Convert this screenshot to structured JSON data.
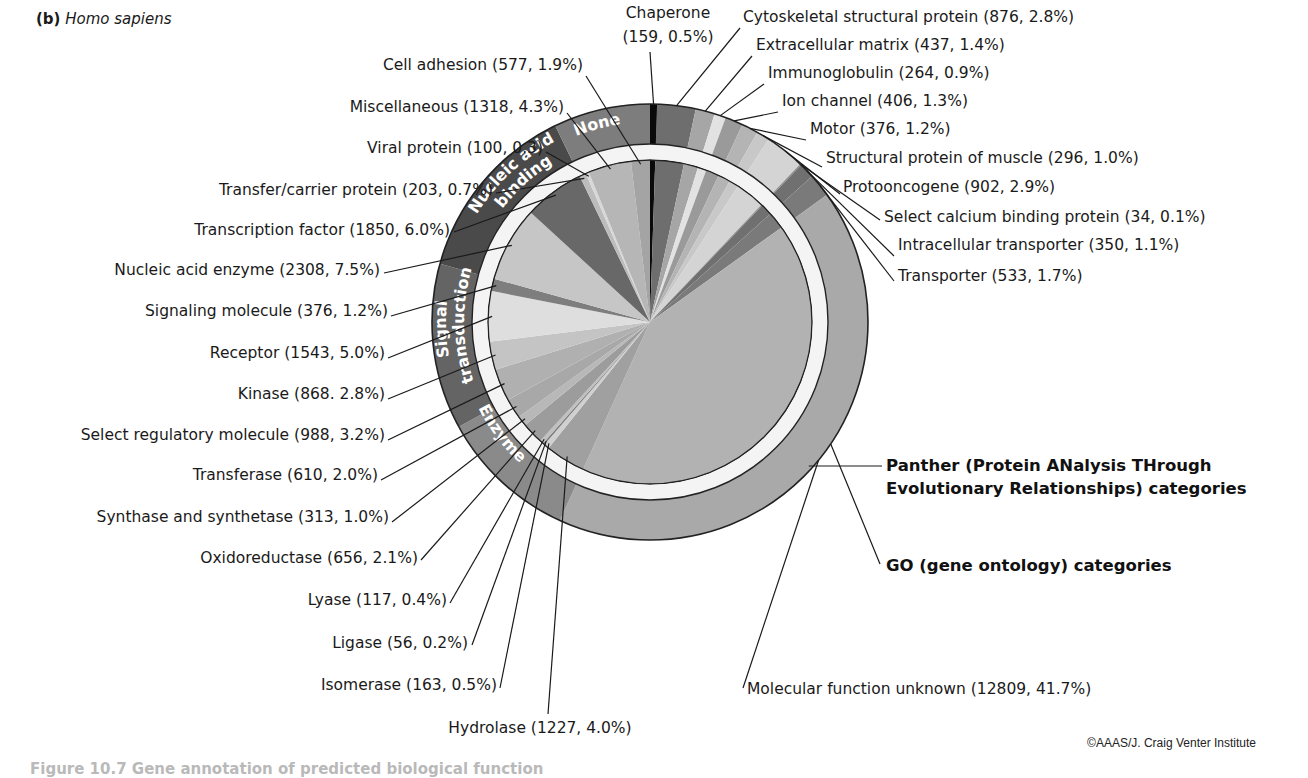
{
  "panel": {
    "label": "(b)",
    "species": "Homo sapiens"
  },
  "credit": "©AAAS/J. Craig Venter Institute",
  "caption_fragment": "Figure 10.7 Gene annotation of predicted biological function",
  "ring_labels": {
    "panther": "Panther (Protein ANalysis THrough Evolutionary Relationships) categories",
    "panther_line1": "Panther (Protein ANalysis THrough",
    "panther_line2": "Evolutionary Relationships) categories",
    "go": "GO (gene ontology) categories"
  },
  "chart_data": {
    "type": "pie",
    "subtype": "nested donut (inner pie = Panther categories, outer ring = GO categories)",
    "title": "(b) Homo sapiens",
    "start_angle_deg": 0,
    "direction": "clockwise",
    "units": "number of genes (percent of total)",
    "inner_series_name": "Panther (Protein ANalysis THrough Evolutionary Relationships) categories",
    "outer_series_name": "GO (gene ontology) categories",
    "slices": [
      {
        "label": "Chaperone",
        "count": 159,
        "percent": 0.5,
        "display": "Chaperone (159, 0.5%)",
        "color": "#0a0a0a",
        "go": "None"
      },
      {
        "label": "Cytoskeletal structural protein",
        "count": 876,
        "percent": 2.8,
        "display": "Cytoskeletal structural protein (876, 2.8%)",
        "color": "#6e6e6e",
        "go": "Other"
      },
      {
        "label": "Extracellular matrix",
        "count": 437,
        "percent": 1.4,
        "display": "Extracellular matrix (437, 1.4%)",
        "color": "#a6a6a6",
        "go": "Other"
      },
      {
        "label": "Immunoglobulin",
        "count": 264,
        "percent": 0.9,
        "display": "Immunoglobulin (264, 0.9%)",
        "color": "#e2e2e2",
        "go": "Other"
      },
      {
        "label": "Ion channel",
        "count": 406,
        "percent": 1.3,
        "display": "Ion channel (406, 1.3%)",
        "color": "#9a9a9a",
        "go": "Other"
      },
      {
        "label": "Motor",
        "count": 376,
        "percent": 1.2,
        "display": "Motor (376, 1.2%)",
        "color": "#b4b4b4",
        "go": "Other"
      },
      {
        "label": "Structural protein of muscle",
        "count": 296,
        "percent": 1.0,
        "display": "Structural protein of muscle (296, 1.0%)",
        "color": "#c8c8c8",
        "go": "Other"
      },
      {
        "label": "Protooncogene",
        "count": 902,
        "percent": 2.9,
        "display": "Protooncogene (902, 2.9%)",
        "color": "#d4d4d4",
        "go": "Other"
      },
      {
        "label": "Select calcium binding protein",
        "count": 34,
        "percent": 0.1,
        "display": "Select calcium binding protein (34, 0.1%)",
        "color": "#8c8c8c",
        "go": "Other"
      },
      {
        "label": "Intracellular transporter",
        "count": 350,
        "percent": 1.1,
        "display": "Intracellular transporter (350, 1.1%)",
        "color": "#707070",
        "go": "Other"
      },
      {
        "label": "Transporter",
        "count": 533,
        "percent": 1.7,
        "display": "Transporter (533, 1.7%)",
        "color": "#7a7a7a",
        "go": "Other"
      },
      {
        "label": "Molecular function unknown",
        "count": 12809,
        "percent": 41.7,
        "display": "Molecular function unknown (12809, 41.7%)",
        "color": "#b2b2b2",
        "go": "Unknown"
      },
      {
        "label": "Hydrolase",
        "count": 1227,
        "percent": 4.0,
        "display": "Hydrolase (1227, 4.0%)",
        "color": "#a0a0a0",
        "go": "Enzyme"
      },
      {
        "label": "Isomerase",
        "count": 163,
        "percent": 0.5,
        "display": "Isomerase (163, 0.5%)",
        "color": "#d0d0d0",
        "go": "Enzyme"
      },
      {
        "label": "Ligase",
        "count": 56,
        "percent": 0.2,
        "display": "Ligase (56, 0.2%)",
        "color": "#7c7c7c",
        "go": "Enzyme"
      },
      {
        "label": "Lyase",
        "count": 117,
        "percent": 0.4,
        "display": "Lyase (117, 0.4%)",
        "color": "#c0c0c0",
        "go": "Enzyme"
      },
      {
        "label": "Oxidoreductase",
        "count": 656,
        "percent": 2.1,
        "display": "Oxidoreductase (656, 2.1%)",
        "color": "#9c9c9c",
        "go": "Enzyme"
      },
      {
        "label": "Synthase and synthetase",
        "count": 313,
        "percent": 1.0,
        "display": "Synthase and synthetase (313, 1.0%)",
        "color": "#b8b8b8",
        "go": "Enzyme"
      },
      {
        "label": "Transferase",
        "count": 610,
        "percent": 2.0,
        "display": "Transferase (610, 2.0%)",
        "color": "#a8a8a8",
        "go": "Enzyme"
      },
      {
        "label": "Select regulatory molecule",
        "count": 988,
        "percent": 3.2,
        "display": "Select regulatory molecule (988, 3.2%)",
        "color": "#b0b0b0",
        "go": "Signal transduction"
      },
      {
        "label": "Kinase",
        "count": 868,
        "percent": 2.8,
        "display": "Kinase (868. 2.8%)",
        "color": "#c4c4c4",
        "go": "Signal transduction"
      },
      {
        "label": "Receptor",
        "count": 1543,
        "percent": 5.0,
        "display": "Receptor (1543, 5.0%)",
        "color": "#dedede",
        "go": "Signal transduction"
      },
      {
        "label": "Signaling molecule",
        "count": 376,
        "percent": 1.2,
        "display": "Signaling molecule (376, 1.2%)",
        "color": "#7e7e7e",
        "go": "Signal transduction"
      },
      {
        "label": "Nucleic acid enzyme",
        "count": 2308,
        "percent": 7.5,
        "display": "Nucleic acid enzyme (2308, 7.5%)",
        "color": "#c6c6c6",
        "go": "Nucleic acid binding"
      },
      {
        "label": "Transcription factor",
        "count": 1850,
        "percent": 6.0,
        "display": "Transcription factor (1850, 6.0%)",
        "color": "#686868",
        "go": "Nucleic acid binding"
      },
      {
        "label": "Transfer/carrier protein",
        "count": 203,
        "percent": 0.7,
        "display": "Transfer/carrier protein (203, 0.7%)",
        "color": "#bcbcbc",
        "go": "None"
      },
      {
        "label": "Viral protein",
        "count": 100,
        "percent": 0.3,
        "display": "Viral protein (100, 0.3)",
        "color": "#d8d8d8",
        "go": "None"
      },
      {
        "label": "Miscellaneous",
        "count": 1318,
        "percent": 4.3,
        "display": "Miscellaneous (1318, 4.3%)",
        "color": "#b6b6b6",
        "go": "None"
      },
      {
        "label": "Cell adhesion",
        "count": 577,
        "percent": 1.9,
        "display": "Cell adhesion (577, 1.9%)",
        "color": "#a4a4a4",
        "go": "None"
      }
    ],
    "outer_ring": [
      {
        "label": "None",
        "color": "#7d7d7d",
        "text_color": "#ffffff",
        "show_text": true
      },
      {
        "label": "Nucleic acid binding",
        "line1": "Nucleic acid",
        "line2": "binding",
        "color": "#4a4a4a",
        "text_color": "#ffffff",
        "show_text": true
      },
      {
        "label": "Signal transduction",
        "line1": "Signal",
        "line2": "transduction",
        "color": "#646464",
        "text_color": "#ffffff",
        "show_text": true
      },
      {
        "label": "Enzyme",
        "color": "#8a8a8a",
        "text_color": "#ffffff",
        "show_text": true
      },
      {
        "label": "Unknown",
        "color": "#a9a9a9",
        "show_text": false
      }
    ],
    "legend": "none (callout labels)"
  }
}
